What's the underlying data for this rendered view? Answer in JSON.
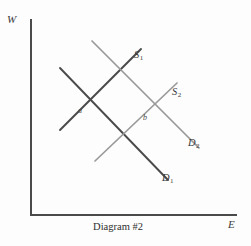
{
  "figure": {
    "caption": "Diagram #2",
    "background_color": "#fdfdfd"
  },
  "axes": {
    "y_label": "W",
    "x_label": "E",
    "axis_color": "#4a4a4a",
    "origin_x": 31,
    "origin_y": 215,
    "y_top": 20,
    "x_right": 236
  },
  "chart_data": {
    "type": "line",
    "title": "Diagram #2",
    "xlabel": "E",
    "ylabel": "W",
    "grid": false,
    "legend": "inline-end-labels",
    "note": "Labor market supply and demand shift diagram; W (wage) on vertical axis, E (employment) on horizontal axis. Curves are straight lines drawn without numeric scales.",
    "series": [
      {
        "name": "D1",
        "label": "D",
        "subscript": "1",
        "kind": "demand",
        "slope": "downward",
        "color": "#4a4a4a",
        "width": 1.9,
        "x": [
          60,
          168
        ],
        "y": [
          68,
          180
        ]
      },
      {
        "name": "S1",
        "label": "S",
        "subscript": "1",
        "kind": "supply",
        "slope": "upward",
        "color": "#4a4a4a",
        "width": 1.9,
        "x": [
          60,
          141
        ],
        "y": [
          130,
          49
        ]
      },
      {
        "name": "D2",
        "label": "D",
        "subscript": "2",
        "kind": "demand",
        "slope": "downward",
        "color": "#9a9a9a",
        "width": 1.7,
        "x": [
          92,
          199
        ],
        "y": [
          41,
          148
        ]
      },
      {
        "name": "S2",
        "label": "S",
        "subscript": "2",
        "kind": "supply",
        "slope": "upward",
        "color": "#9a9a9a",
        "width": 1.7,
        "x": [
          95,
          177
        ],
        "y": [
          161,
          83
        ]
      }
    ],
    "annotations": [
      {
        "name": "a",
        "label": "a",
        "x": 85,
        "y": 105,
        "describes": "intersection of D1 and S1"
      },
      {
        "name": "b",
        "label": "b",
        "x": 148,
        "y": 112,
        "describes": "intersection of D2 and S2"
      }
    ]
  },
  "curve_labels": {
    "s1": {
      "base": "S",
      "sub": "1"
    },
    "s2": {
      "base": "S",
      "sub": "2"
    },
    "d1": {
      "base": "D",
      "sub": "1"
    },
    "d2": {
      "base": "D",
      "sub": "2"
    }
  },
  "point_labels": {
    "a": "a",
    "b": "b"
  }
}
